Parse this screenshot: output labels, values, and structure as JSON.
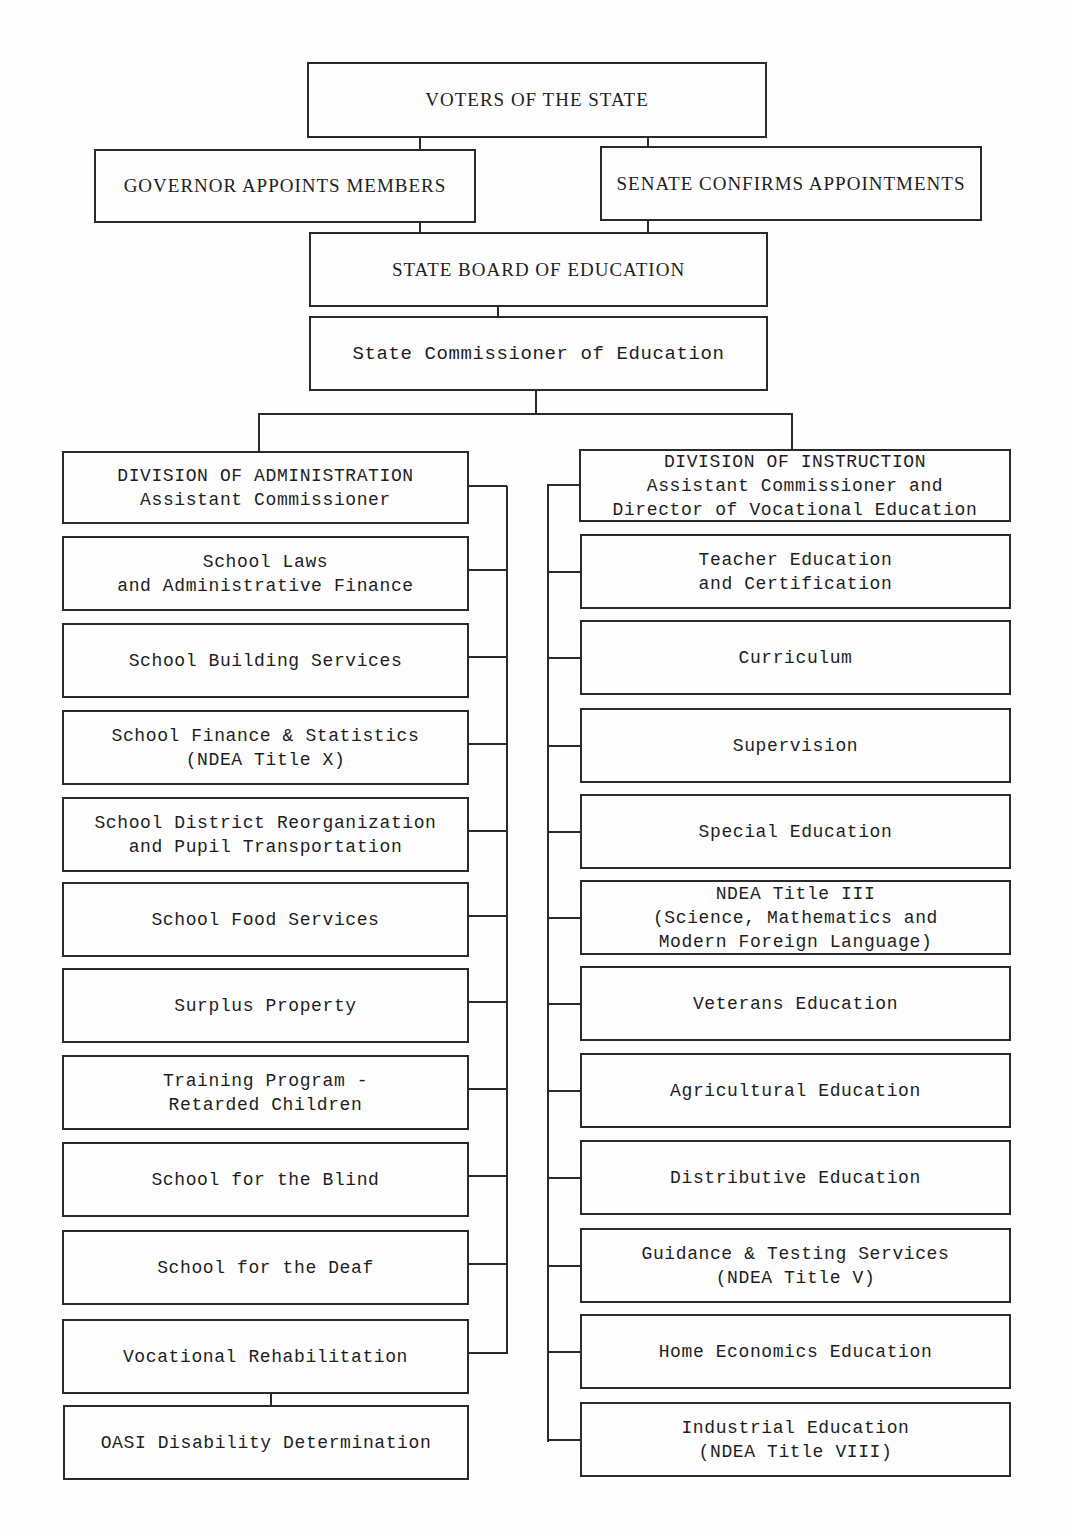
{
  "top": {
    "voters": "VOTERS OF THE STATE",
    "governor": "GOVERNOR APPOINTS MEMBERS",
    "senate": "SENATE CONFIRMS APPOINTMENTS",
    "board": "STATE BOARD OF EDUCATION",
    "commissioner": "State Commissioner of Education"
  },
  "administration": {
    "header": [
      "DIVISION OF ADMINISTRATION",
      "Assistant Commissioner"
    ],
    "units": [
      [
        "School Laws",
        "and Administrative Finance"
      ],
      [
        "School Building Services"
      ],
      [
        "School Finance & Statistics",
        "(NDEA Title X)"
      ],
      [
        "School District Reorganization",
        "and Pupil Transportation"
      ],
      [
        "School Food Services"
      ],
      [
        "Surplus Property"
      ],
      [
        "Training Program -",
        "Retarded Children"
      ],
      [
        "School for the Blind"
      ],
      [
        "School for the Deaf"
      ],
      [
        "Vocational Rehabilitation"
      ]
    ],
    "sub_unit": [
      "OASI Disability Determination"
    ]
  },
  "instruction": {
    "header": [
      "DIVISION OF INSTRUCTION",
      "Assistant Commissioner and",
      "Director of Vocational Education"
    ],
    "units": [
      [
        "Teacher Education",
        "and Certification"
      ],
      [
        "Curriculum"
      ],
      [
        "Supervision"
      ],
      [
        "Special Education"
      ],
      [
        "NDEA Title III",
        "(Science, Mathematics and",
        "Modern Foreign Language)"
      ],
      [
        "Veterans Education"
      ],
      [
        "Agricultural Education"
      ],
      [
        "Distributive Education"
      ],
      [
        "Guidance & Testing Services",
        "(NDEA Title V)"
      ],
      [
        "Home Economics Education"
      ],
      [
        "Industrial Education",
        "(NDEA Title VIII)"
      ]
    ]
  }
}
